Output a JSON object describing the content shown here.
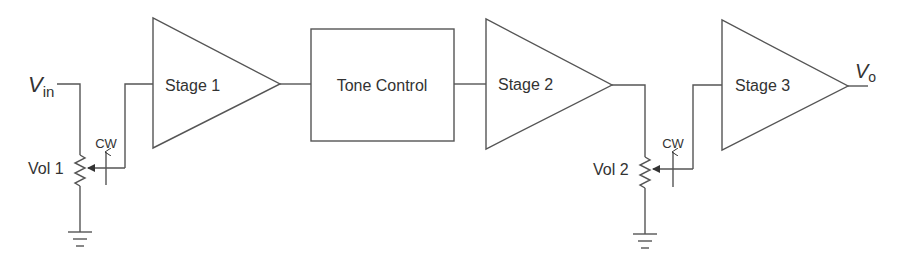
{
  "diagram": {
    "type": "audio amplifier signal chain block diagram",
    "colors": {
      "stroke": "#555555",
      "text": "#333333",
      "background": "#ffffff"
    },
    "input": {
      "label_main": "V",
      "label_sub": "in"
    },
    "output": {
      "label_main": "V",
      "label_sub": "o"
    },
    "blocks": [
      {
        "id": "stage1",
        "shape": "triangle-amplifier",
        "label": "Stage 1"
      },
      {
        "id": "tone",
        "shape": "rectangle",
        "label": "Tone Control"
      },
      {
        "id": "stage2",
        "shape": "triangle-amplifier",
        "label": "Stage 2"
      },
      {
        "id": "stage3",
        "shape": "triangle-amplifier",
        "label": "Stage 3"
      }
    ],
    "potentiometers": [
      {
        "id": "vol1",
        "label": "Vol 1",
        "direction_label": "CW"
      },
      {
        "id": "vol2",
        "label": "Vol 2",
        "direction_label": "CW"
      }
    ],
    "connections": [
      "Vin -> Vol 1 (top)",
      "Vol 1 wiper -> Stage 1",
      "Stage 1 -> Tone Control",
      "Tone Control -> Stage 2",
      "Stage 2 -> Vol 2 (top)",
      "Vol 2 wiper -> Stage 3",
      "Stage 3 -> Vo",
      "Vol 1 (bottom) -> ground",
      "Vol 2 (bottom) -> ground"
    ]
  }
}
